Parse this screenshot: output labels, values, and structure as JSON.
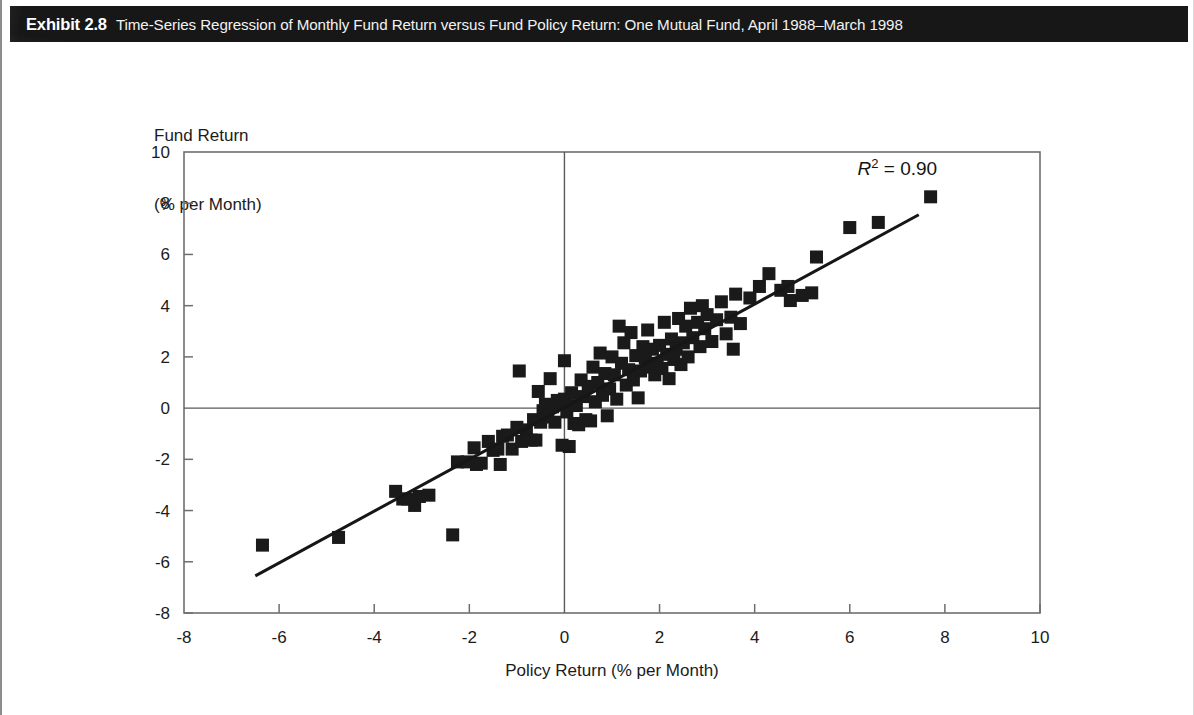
{
  "exhibit": {
    "label": "Exhibit 2.8",
    "title": "Time-Series Regression of Monthly Fund Return versus Fund Policy Return: One Mutual Fund, April 1988–March 1998"
  },
  "chart_data": {
    "type": "scatter",
    "title": "Time-Series Regression of Monthly Fund Return versus Fund Policy Return: One Mutual Fund, April 1988–March 1998",
    "xlabel": "Policy Return (% per Month)",
    "ylabel": "Fund Return\n(% per Month)",
    "ylabel_line1": "Fund Return",
    "ylabel_line2": "(% per Month)",
    "xlim": [
      -8,
      10
    ],
    "ylim": [
      -8,
      10
    ],
    "xticks": [
      -8,
      -6,
      -4,
      -2,
      0,
      2,
      4,
      6,
      8,
      10
    ],
    "yticks": [
      -8,
      -6,
      -4,
      -2,
      0,
      2,
      4,
      6,
      8,
      10
    ],
    "xtick_labels": [
      "-8",
      "-6",
      "-4",
      "-2",
      "0",
      "2",
      "4",
      "6",
      "8",
      "10"
    ],
    "ytick_labels": [
      "-8",
      "-6",
      "-4",
      "-2",
      "0",
      "2",
      "4",
      "6",
      "8",
      "10"
    ],
    "grid": false,
    "zero_lines": true,
    "marker": "square",
    "marker_color": "#1a1a1a",
    "marker_size": 13,
    "annotations": [
      {
        "name": "r-squared",
        "text_italic": "R",
        "superscript": "2",
        "text_rest": " = 0.90",
        "full_text": "R2 = 0.90",
        "x": 7.0,
        "y": 9.1
      }
    ],
    "fit_line": {
      "name": "regression-line",
      "color": "#161616",
      "width": 3,
      "x_start": -6.5,
      "y_start": -6.55,
      "x_end": 7.45,
      "y_end": 7.55,
      "slope": 1.01,
      "intercept": 0.02
    },
    "series": [
      {
        "name": "Monthly returns",
        "points": [
          [
            -6.35,
            -5.35
          ],
          [
            -4.75,
            -5.05
          ],
          [
            -3.55,
            -3.25
          ],
          [
            -3.4,
            -3.55
          ],
          [
            -3.3,
            -3.55
          ],
          [
            -3.15,
            -3.8
          ],
          [
            -3.05,
            -3.45
          ],
          [
            -2.85,
            -3.4
          ],
          [
            -2.35,
            -4.95
          ],
          [
            -2.25,
            -2.1
          ],
          [
            -2.05,
            -2.1
          ],
          [
            -1.9,
            -1.55
          ],
          [
            -1.85,
            -2.2
          ],
          [
            -1.75,
            -2.15
          ],
          [
            -1.6,
            -1.3
          ],
          [
            -1.5,
            -1.65
          ],
          [
            -1.4,
            -1.6
          ],
          [
            -1.35,
            -2.2
          ],
          [
            -1.3,
            -1.1
          ],
          [
            -1.2,
            -1.05
          ],
          [
            -1.1,
            -1.6
          ],
          [
            -1.0,
            -0.75
          ],
          [
            -0.95,
            1.45
          ],
          [
            -0.9,
            -1.3
          ],
          [
            -0.8,
            -0.85
          ],
          [
            -0.7,
            -1.25
          ],
          [
            -0.65,
            -0.45
          ],
          [
            -0.6,
            -1.25
          ],
          [
            -0.55,
            0.65
          ],
          [
            -0.5,
            -0.55
          ],
          [
            -0.45,
            -0.1
          ],
          [
            -0.4,
            0.15
          ],
          [
            -0.35,
            -0.35
          ],
          [
            -0.3,
            1.15
          ],
          [
            -0.25,
            0.05
          ],
          [
            -0.2,
            -0.55
          ],
          [
            -0.15,
            0.3
          ],
          [
            -0.1,
            0.15
          ],
          [
            -0.05,
            -1.45
          ],
          [
            0.0,
            0.35
          ],
          [
            0.0,
            1.85
          ],
          [
            0.05,
            -0.15
          ],
          [
            0.1,
            -1.5
          ],
          [
            0.15,
            0.6
          ],
          [
            0.2,
            -0.6
          ],
          [
            0.25,
            0.1
          ],
          [
            0.3,
            -0.65
          ],
          [
            0.35,
            1.1
          ],
          [
            0.4,
            0.45
          ],
          [
            0.45,
            -0.45
          ],
          [
            0.5,
            0.85
          ],
          [
            0.55,
            -0.5
          ],
          [
            0.6,
            1.6
          ],
          [
            0.65,
            0.25
          ],
          [
            0.7,
            1.0
          ],
          [
            0.75,
            2.15
          ],
          [
            0.8,
            0.5
          ],
          [
            0.85,
            1.35
          ],
          [
            0.9,
            -0.3
          ],
          [
            0.95,
            0.75
          ],
          [
            1.0,
            2.0
          ],
          [
            1.05,
            1.3
          ],
          [
            1.1,
            0.35
          ],
          [
            1.15,
            3.2
          ],
          [
            1.2,
            1.75
          ],
          [
            1.25,
            2.55
          ],
          [
            1.3,
            0.9
          ],
          [
            1.35,
            1.5
          ],
          [
            1.4,
            2.95
          ],
          [
            1.45,
            1.1
          ],
          [
            1.5,
            2.05
          ],
          [
            1.55,
            0.4
          ],
          [
            1.6,
            1.45
          ],
          [
            1.65,
            2.4
          ],
          [
            1.7,
            1.95
          ],
          [
            1.75,
            3.05
          ],
          [
            1.8,
            1.6
          ],
          [
            1.85,
            2.3
          ],
          [
            1.9,
            1.3
          ],
          [
            1.95,
            1.75
          ],
          [
            2.0,
            2.45
          ],
          [
            2.05,
            1.55
          ],
          [
            2.1,
            3.35
          ],
          [
            2.15,
            2.1
          ],
          [
            2.2,
            1.15
          ],
          [
            2.25,
            2.7
          ],
          [
            2.3,
            1.9
          ],
          [
            2.35,
            2.3
          ],
          [
            2.4,
            3.5
          ],
          [
            2.45,
            1.7
          ],
          [
            2.5,
            2.55
          ],
          [
            2.55,
            3.2
          ],
          [
            2.6,
            2.0
          ],
          [
            2.65,
            3.9
          ],
          [
            2.7,
            2.75
          ],
          [
            2.8,
            3.35
          ],
          [
            2.85,
            2.4
          ],
          [
            2.9,
            4.0
          ],
          [
            2.95,
            3.1
          ],
          [
            3.0,
            3.65
          ],
          [
            3.1,
            2.6
          ],
          [
            3.2,
            3.45
          ],
          [
            3.3,
            4.15
          ],
          [
            3.4,
            2.9
          ],
          [
            3.5,
            3.55
          ],
          [
            3.55,
            2.3
          ],
          [
            3.6,
            4.45
          ],
          [
            3.7,
            3.3
          ],
          [
            3.9,
            4.3
          ],
          [
            4.1,
            4.75
          ],
          [
            4.3,
            5.25
          ],
          [
            4.55,
            4.6
          ],
          [
            4.7,
            4.75
          ],
          [
            4.75,
            4.2
          ],
          [
            5.0,
            4.4
          ],
          [
            5.2,
            4.5
          ],
          [
            5.3,
            5.9
          ],
          [
            6.0,
            7.05
          ],
          [
            6.6,
            7.25
          ],
          [
            7.7,
            8.25
          ]
        ]
      }
    ]
  }
}
